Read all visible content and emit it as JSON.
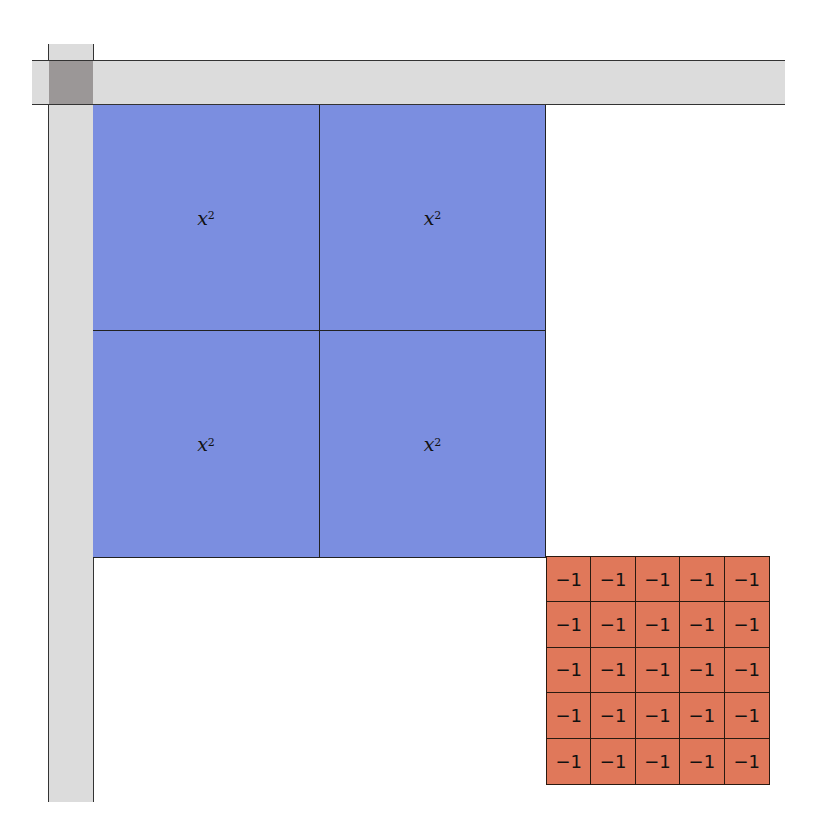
{
  "diagram": {
    "title": "",
    "unit_bars": {
      "color": "#dcdcdc",
      "overlap_color": "#9b9797"
    },
    "positive_squares": {
      "color": "#7b8ee0",
      "rows": 2,
      "cols": 2,
      "cells": [
        {
          "base": "x",
          "exp": "2"
        },
        {
          "base": "x",
          "exp": "2"
        },
        {
          "base": "x",
          "exp": "2"
        },
        {
          "base": "x",
          "exp": "2"
        }
      ]
    },
    "negative_units": {
      "color": "#e0785a",
      "rows": 5,
      "cols": 5,
      "label": "−1",
      "cells": [
        "−1",
        "−1",
        "−1",
        "−1",
        "−1",
        "−1",
        "−1",
        "−1",
        "−1",
        "−1",
        "−1",
        "−1",
        "−1",
        "−1",
        "−1",
        "−1",
        "−1",
        "−1",
        "−1",
        "−1",
        "−1",
        "−1",
        "−1",
        "−1",
        "−1"
      ]
    }
  }
}
